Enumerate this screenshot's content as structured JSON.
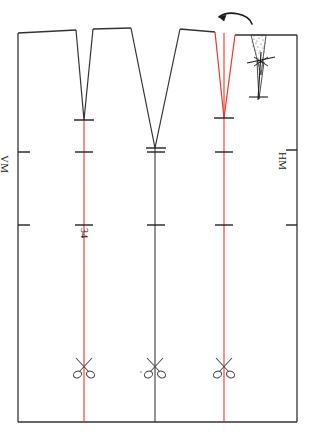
{
  "document": {
    "type": "sewing-pattern-technical-drawing",
    "title": "Rock Schnittmuster - Vorderteil mit Abnähern",
    "orientation": "rotated-90-degrees",
    "background_color": "#ffffff"
  },
  "labels": {
    "center_front": "VM",
    "center_back": "HM",
    "size": "34"
  },
  "colors": {
    "outline": "#333333",
    "grainline_marked": "#e8382f",
    "grainline_center": "#3a3a3a",
    "tick": "#222222",
    "stipple": "#555555",
    "annotation": "#1a1a1a"
  },
  "geometry": {
    "panel": {
      "left_x": 18,
      "right_x": 297,
      "top_y": 33,
      "bottom_y": 422
    },
    "vertical_lines": [
      {
        "name": "grainline-left",
        "x": 84,
        "color": "red",
        "top_y": 118,
        "bottom_y": 422
      },
      {
        "name": "centerline-middle",
        "x": 155,
        "color": "black",
        "top_y": 148,
        "bottom_y": 422
      },
      {
        "name": "grainline-right",
        "x": 224,
        "color": "red",
        "top_y": 33,
        "bottom_y": 422
      }
    ],
    "tick_rows_y": [
      152,
      225
    ],
    "darts": [
      {
        "name": "dart-left",
        "apex_x": 84,
        "apex_y": 120,
        "left_top_x": 76,
        "right_top_x": 93,
        "top_y": 34,
        "style": "solid-black",
        "width_mm": "narrow"
      },
      {
        "name": "dart-middle",
        "apex_x": 155,
        "apex_y": 148,
        "left_top_x": 131,
        "right_top_x": 180,
        "top_y": 31,
        "style": "solid-black",
        "width_mm": "wide"
      },
      {
        "name": "dart-right",
        "apex_x": 224,
        "apex_y": 118,
        "left_top_x": 215,
        "right_top_x": 235,
        "top_y": 33,
        "style": "solid-red",
        "width_mm": "narrow"
      }
    ],
    "scissors_y": 366,
    "scissors_x": [
      84,
      155,
      224
    ],
    "fold_detail": {
      "arrow_from_x": 238,
      "arrow_to_x": 218,
      "arrow_y": 18,
      "stipple_x": 258,
      "stipple_top_y": 35,
      "stipple_bottom_y": 72,
      "needle_x": 261,
      "needle_top_y": 55,
      "needle_bottom_y": 102
    }
  },
  "annotations": {
    "fold_arrow": "fold-direction-arrow",
    "folded_dart": "folded-dart-shaded",
    "pin_marks": "pin-cross-marks"
  },
  "icons": {
    "scissors": "scissors-icon",
    "arrow": "curved-arrow-icon",
    "pin": "pin-cross-icon"
  }
}
